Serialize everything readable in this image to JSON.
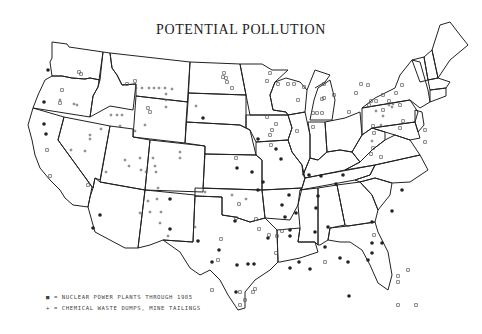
{
  "title": "POTENTIAL POLLUTION",
  "legend": [
    {
      "symbol": "■",
      "label": "= NUCLEAR POWER PLANTS THROUGH 1985"
    },
    {
      "symbol": "+",
      "label": "= CHEMICAL WASTE DUMPS, MINE TAILINGS"
    }
  ],
  "colors": {
    "line": "#222222",
    "marker_dark": "#222222",
    "marker_light": "#555555",
    "background": "#ffffff"
  },
  "markers": {
    "nuclear_dots": [
      [
        48,
        70
      ],
      [
        44,
        102
      ],
      [
        44,
        124
      ],
      [
        46,
        134
      ],
      [
        100,
        215
      ],
      [
        93,
        228
      ],
      [
        170,
        199
      ],
      [
        170,
        229
      ],
      [
        203,
        118
      ],
      [
        237,
        168
      ],
      [
        235,
        221
      ],
      [
        198,
        241
      ],
      [
        219,
        250
      ],
      [
        237,
        265
      ],
      [
        236,
        292
      ],
      [
        258,
        190
      ],
      [
        289,
        195
      ],
      [
        318,
        196
      ],
      [
        285,
        217
      ],
      [
        282,
        205
      ],
      [
        263,
        182
      ],
      [
        290,
        230
      ],
      [
        268,
        238
      ],
      [
        336,
        184
      ],
      [
        343,
        175
      ],
      [
        321,
        176
      ],
      [
        316,
        208
      ],
      [
        315,
        232
      ],
      [
        328,
        227
      ],
      [
        325,
        247
      ],
      [
        340,
        258
      ],
      [
        349,
        296
      ],
      [
        372,
        222
      ],
      [
        348,
        262
      ],
      [
        372,
        253
      ],
      [
        382,
        243
      ],
      [
        402,
        190
      ],
      [
        392,
        211
      ],
      [
        368,
        260
      ],
      [
        299,
        262
      ],
      [
        290,
        268
      ],
      [
        310,
        269
      ],
      [
        309,
        175
      ],
      [
        252,
        172
      ],
      [
        281,
        159
      ],
      [
        276,
        149
      ],
      [
        258,
        139
      ],
      [
        290,
        236
      ],
      [
        296,
        213
      ],
      [
        372,
        243
      ],
      [
        212,
        262
      ],
      [
        248,
        264
      ],
      [
        254,
        264
      ]
    ],
    "nuclear_squares": [
      [
        62,
        90
      ],
      [
        79,
        72
      ],
      [
        81,
        74
      ],
      [
        60,
        103
      ],
      [
        127,
        84
      ],
      [
        135,
        81
      ],
      [
        150,
        112
      ],
      [
        47,
        150
      ],
      [
        148,
        108
      ],
      [
        50,
        176
      ],
      [
        88,
        185
      ],
      [
        224,
        73
      ],
      [
        226,
        78
      ],
      [
        267,
        81
      ],
      [
        270,
        73
      ],
      [
        223,
        77
      ],
      [
        232,
        88
      ],
      [
        267,
        117
      ],
      [
        313,
        113
      ],
      [
        317,
        113
      ],
      [
        322,
        113
      ],
      [
        297,
        131
      ],
      [
        313,
        127
      ],
      [
        369,
        105
      ],
      [
        371,
        101
      ],
      [
        376,
        101
      ],
      [
        383,
        95
      ],
      [
        400,
        105
      ],
      [
        383,
        110
      ],
      [
        400,
        128
      ],
      [
        373,
        148
      ],
      [
        381,
        157
      ],
      [
        389,
        101
      ],
      [
        403,
        121
      ],
      [
        298,
        100
      ],
      [
        304,
        87
      ],
      [
        324,
        84
      ],
      [
        278,
        84
      ],
      [
        294,
        84
      ],
      [
        288,
        84
      ],
      [
        361,
        84
      ],
      [
        368,
        85
      ],
      [
        373,
        126
      ],
      [
        374,
        133
      ],
      [
        371,
        154
      ],
      [
        322,
        99
      ],
      [
        324,
        98
      ],
      [
        349,
        112
      ],
      [
        356,
        93
      ],
      [
        396,
        93
      ],
      [
        402,
        85
      ],
      [
        425,
        130
      ],
      [
        425,
        142
      ],
      [
        325,
        262
      ],
      [
        408,
        270
      ],
      [
        416,
        305
      ],
      [
        334,
        95
      ],
      [
        374,
        235
      ],
      [
        212,
        290
      ],
      [
        221,
        239
      ],
      [
        259,
        229
      ],
      [
        256,
        219
      ],
      [
        272,
        130
      ],
      [
        276,
        124
      ],
      [
        227,
        82
      ],
      [
        270,
        135
      ],
      [
        271,
        145
      ],
      [
        236,
        158
      ],
      [
        240,
        292
      ],
      [
        245,
        300
      ],
      [
        255,
        289
      ],
      [
        253,
        292
      ],
      [
        240,
        305
      ],
      [
        236,
        218
      ],
      [
        239,
        204
      ],
      [
        276,
        253
      ],
      [
        277,
        236
      ],
      [
        269,
        235
      ],
      [
        218,
        260
      ],
      [
        398,
        305
      ],
      [
        398,
        282
      ],
      [
        398,
        276
      ],
      [
        282,
        231
      ]
    ],
    "chemical_plus": [
      [
        60,
        100
      ],
      [
        74,
        104
      ],
      [
        77,
        105
      ],
      [
        136,
        88
      ],
      [
        142,
        88
      ],
      [
        149,
        88
      ],
      [
        154,
        88
      ],
      [
        159,
        88
      ],
      [
        165,
        88
      ],
      [
        166,
        94
      ],
      [
        166,
        100
      ],
      [
        166,
        107
      ],
      [
        172,
        89
      ],
      [
        111,
        115
      ],
      [
        117,
        115
      ],
      [
        122,
        115
      ],
      [
        145,
        125
      ],
      [
        120,
        126
      ],
      [
        135,
        131
      ],
      [
        85,
        151
      ],
      [
        90,
        139
      ],
      [
        71,
        150
      ],
      [
        90,
        135
      ],
      [
        101,
        129
      ],
      [
        125,
        160
      ],
      [
        140,
        158
      ],
      [
        153,
        158
      ],
      [
        155,
        166
      ],
      [
        129,
        166
      ],
      [
        106,
        172
      ],
      [
        141,
        170
      ],
      [
        180,
        158
      ],
      [
        180,
        152
      ],
      [
        146,
        172
      ],
      [
        156,
        172
      ],
      [
        158,
        188
      ],
      [
        148,
        201
      ],
      [
        157,
        199
      ],
      [
        150,
        212
      ],
      [
        161,
        212
      ],
      [
        140,
        213
      ],
      [
        160,
        223
      ],
      [
        196,
        106
      ],
      [
        232,
        195
      ],
      [
        246,
        199
      ],
      [
        205,
        192
      ],
      [
        195,
        227
      ],
      [
        168,
        236
      ],
      [
        381,
        125
      ],
      [
        372,
        141
      ],
      [
        393,
        104
      ],
      [
        389,
        105
      ],
      [
        383,
        116
      ],
      [
        376,
        111
      ],
      [
        392,
        107
      ]
    ]
  }
}
